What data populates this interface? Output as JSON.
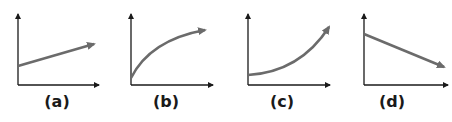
{
  "figure": {
    "colors": {
      "axis": "#1a1a1a",
      "curve": "#6b6b6b",
      "label": "#1a1a1a",
      "background": "#ffffff"
    },
    "panels": [
      {
        "label": "(a)",
        "relationship": "linear increasing with positive intercept",
        "axes": {
          "origin": [
            18,
            85
          ],
          "y_top": 13,
          "x_right": 100
        },
        "curve_type": "line",
        "label_x": 57
      },
      {
        "label": "(b)",
        "relationship": "concave increasing (decelerating growth)",
        "axes": {
          "origin": [
            131,
            85
          ],
          "y_top": 13,
          "x_right": 214
        },
        "curve_type": "concave-up-to-flatten",
        "label_x": 166
      },
      {
        "label": "(c)",
        "relationship": "convex increasing (accelerating growth)",
        "axes": {
          "origin": [
            248,
            85
          ],
          "y_top": 13,
          "x_right": 331
        },
        "curve_type": "convex",
        "label_x": 282
      },
      {
        "label": "(d)",
        "relationship": "linear decreasing",
        "axes": {
          "origin": [
            364,
            85
          ],
          "y_top": 13,
          "x_right": 449
        },
        "curve_type": "line",
        "label_x": 392
      }
    ]
  }
}
